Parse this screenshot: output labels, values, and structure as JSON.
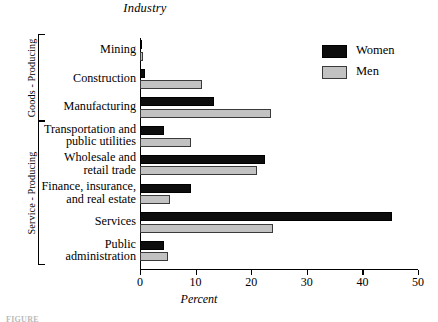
{
  "chart_data": {
    "type": "bar",
    "orientation": "horizontal",
    "title": "Industry",
    "xlabel": "Percent",
    "ylabel": "",
    "xlim": [
      0,
      50
    ],
    "xticks": [
      0,
      10,
      20,
      30,
      40,
      50
    ],
    "xtick_labels": [
      "0",
      "10",
      "20",
      "30",
      "40",
      "50"
    ],
    "grid": false,
    "legend_position": "top-right",
    "categories": [
      "Mining",
      "Construction",
      "Manufacturing",
      "Transportation and public utilities",
      "Wholesale and retail trade",
      "Finance, insurance, and real estate",
      "Services",
      "Public administration"
    ],
    "series": [
      {
        "name": "Women",
        "color": "#0d0d0d",
        "values": [
          0.2,
          0.9,
          13.3,
          4.4,
          22.4,
          9.2,
          45.4,
          4.3
        ]
      },
      {
        "name": "Men",
        "color": "#c2c2c2",
        "values": [
          0.6,
          11.2,
          23.5,
          9.2,
          21.0,
          5.4,
          23.9,
          5.0
        ]
      }
    ],
    "groups": [
      {
        "label": "Goods - Producing",
        "categories": [
          "Mining",
          "Construction",
          "Manufacturing"
        ]
      },
      {
        "label": "Service - Producing",
        "categories": [
          "Transportation and public utilities",
          "Wholesale and retail trade",
          "Finance, insurance, and real estate",
          "Services",
          "Public administration"
        ]
      }
    ]
  },
  "chart": {
    "title": "Industry",
    "xaxis_label": "Percent",
    "tick_labels": [
      "0",
      "10",
      "20",
      "30",
      "40",
      "50"
    ],
    "category_labels": [
      {
        "line1": "Mining",
        "line2": ""
      },
      {
        "line1": "Construction",
        "line2": ""
      },
      {
        "line1": "Manufacturing",
        "line2": ""
      },
      {
        "line1": "Transportation and",
        "line2": "public utilities"
      },
      {
        "line1": "Wholesale and",
        "line2": "retail trade"
      },
      {
        "line1": "Finance, insurance,",
        "line2": "and real estate"
      },
      {
        "line1": "Services",
        "line2": ""
      },
      {
        "line1": "Public",
        "line2": "administration"
      }
    ],
    "group_labels": {
      "goods": "Goods - Producing",
      "service": "Service - Producing"
    }
  },
  "legend": {
    "items": [
      {
        "label": "Women",
        "swatch": "black-swatch-icon"
      },
      {
        "label": "Men",
        "swatch": "gray-swatch-icon"
      }
    ]
  },
  "caption": {
    "fragment": "FIGURE"
  }
}
